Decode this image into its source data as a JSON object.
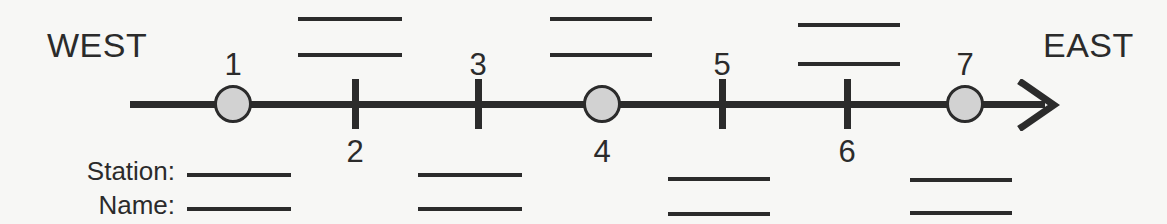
{
  "diagram": {
    "title_west": "WEST",
    "title_east": "EAST",
    "axis": {
      "start_x": 130,
      "end_x": 1045,
      "y": 105,
      "arrow_tip_x": 1058,
      "arrow_direction": "east"
    },
    "stations": [
      {
        "number": "1",
        "x": 233,
        "marker": "circle",
        "label_side": "above"
      },
      {
        "number": "2",
        "x": 355,
        "marker": "tick",
        "label_side": "below"
      },
      {
        "number": "3",
        "x": 478,
        "marker": "tick",
        "label_side": "above"
      },
      {
        "number": "4",
        "x": 602,
        "marker": "circle",
        "label_side": "below"
      },
      {
        "number": "5",
        "x": 722,
        "marker": "tick",
        "label_side": "above"
      },
      {
        "number": "6",
        "x": 847,
        "marker": "tick",
        "label_side": "below"
      },
      {
        "number": "7",
        "x": 965,
        "marker": "circle",
        "label_side": "above"
      }
    ],
    "fields": {
      "station_label": "Station:",
      "name_label": "Name:"
    },
    "blank_rules_above": [
      {
        "x": 298,
        "y": 17,
        "width": 104
      },
      {
        "x": 298,
        "y": 53,
        "width": 104
      },
      {
        "x": 550,
        "y": 17,
        "width": 102
      },
      {
        "x": 550,
        "y": 53,
        "width": 102
      },
      {
        "x": 798,
        "y": 23,
        "width": 102
      },
      {
        "x": 798,
        "y": 62,
        "width": 102
      }
    ],
    "blank_rules_below": [
      {
        "x": 187,
        "y": 173,
        "width": 104
      },
      {
        "x": 187,
        "y": 207,
        "width": 104
      },
      {
        "x": 418,
        "y": 173,
        "width": 104
      },
      {
        "x": 418,
        "y": 207,
        "width": 104
      },
      {
        "x": 668,
        "y": 177,
        "width": 102
      },
      {
        "x": 668,
        "y": 212,
        "width": 102
      },
      {
        "x": 910,
        "y": 178,
        "width": 102
      },
      {
        "x": 910,
        "y": 211,
        "width": 102
      }
    ],
    "colors": {
      "background": "#f7f7f5",
      "ink": "#2b2b2b",
      "circle_fill": "#d2d2d2"
    }
  }
}
